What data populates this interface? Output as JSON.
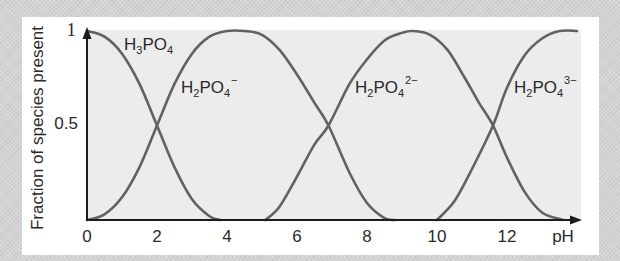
{
  "chart_data": {
    "type": "line",
    "title": "",
    "xlabel": "pH",
    "ylabel": "Fraction of species present",
    "xlim": [
      0,
      14
    ],
    "ylim": [
      0,
      1
    ],
    "x_ticks": [
      "0",
      "2",
      "4",
      "6",
      "8",
      "10",
      "12"
    ],
    "y_ticks": [
      "0.5",
      "1"
    ],
    "grid": false,
    "legend": "inline labels",
    "crossing_points_pH": [
      2.0,
      6.9,
      11.6
    ],
    "series": [
      {
        "name": "H3PO4",
        "label_main": "H",
        "label_sub1": "3",
        "label_mid": "PO",
        "label_sub2": "4",
        "label_sup": "",
        "x": [
          0,
          0.5,
          1.0,
          1.5,
          2.0,
          2.5,
          3.0,
          3.5,
          3.8
        ],
        "values": [
          1.0,
          0.97,
          0.88,
          0.72,
          0.5,
          0.28,
          0.11,
          0.02,
          0.0
        ]
      },
      {
        "name": "H2PO4-",
        "label_main": "H",
        "label_sub1": "2",
        "label_mid": "PO",
        "label_sub2": "4",
        "label_sup": "−",
        "x": [
          0,
          0.5,
          1.0,
          1.5,
          2.0,
          2.5,
          3.0,
          3.5,
          4.0,
          4.5,
          5.0,
          5.5,
          6.0,
          6.5,
          6.9,
          7.5,
          8.0,
          8.5,
          8.8
        ],
        "values": [
          0.0,
          0.03,
          0.12,
          0.28,
          0.5,
          0.72,
          0.88,
          0.97,
          1.0,
          1.0,
          0.98,
          0.9,
          0.77,
          0.62,
          0.5,
          0.25,
          0.09,
          0.01,
          0.0
        ]
      },
      {
        "name": "H2PO4 2-",
        "label_main": "H",
        "label_sub1": "2",
        "label_mid": "PO",
        "label_sub2": "4",
        "label_sup": "2−",
        "x": [
          5.1,
          5.5,
          6.0,
          6.5,
          6.9,
          7.5,
          8.0,
          8.5,
          9.0,
          9.3,
          9.8,
          10.3,
          10.8,
          11.2,
          11.6,
          12.0,
          12.5,
          13.0,
          13.6
        ],
        "values": [
          0.0,
          0.07,
          0.23,
          0.4,
          0.5,
          0.72,
          0.85,
          0.95,
          0.99,
          1.0,
          0.98,
          0.9,
          0.75,
          0.62,
          0.5,
          0.33,
          0.15,
          0.04,
          0.0
        ]
      },
      {
        "name": "H2PO4 3-",
        "label_main": "H",
        "label_sub1": "2",
        "label_mid": "PO",
        "label_sub2": "4",
        "label_sup": "3−",
        "x": [
          10.0,
          10.5,
          11.0,
          11.6,
          12.0,
          12.5,
          13.0,
          13.5,
          14.0
        ],
        "values": [
          0.0,
          0.1,
          0.27,
          0.5,
          0.7,
          0.87,
          0.96,
          1.0,
          1.0
        ]
      }
    ]
  },
  "axes": {
    "x_axis_label": "pH",
    "y_axis_label": "Fraction of species present",
    "x_ticks": [
      {
        "label": "0",
        "v": 0
      },
      {
        "label": "2",
        "v": 2
      },
      {
        "label": "4",
        "v": 4
      },
      {
        "label": "6",
        "v": 6
      },
      {
        "label": "8",
        "v": 8
      },
      {
        "label": "10",
        "v": 10
      },
      {
        "label": "12",
        "v": 12
      }
    ],
    "y_ticks": [
      {
        "label": "1",
        "v": 1
      },
      {
        "label": "0.5",
        "v": 0.5
      }
    ]
  },
  "labels": {
    "h3po4": {
      "a": "H",
      "b": "3",
      "c": "PO",
      "d": "4",
      "e": ""
    },
    "h2po4_minus": {
      "a": "H",
      "b": "2",
      "c": "PO",
      "d": "4",
      "e": "−"
    },
    "h2po4_2minus": {
      "a": "H",
      "b": "2",
      "c": "PO",
      "d": "4",
      "e": "2−"
    },
    "h2po4_3minus": {
      "a": "H",
      "b": "2",
      "c": "PO",
      "d": "4",
      "e": "3−"
    }
  },
  "colors": {
    "curve": "#626262",
    "axis": "#1c1c1c",
    "plot_bg": "#ececec",
    "panel_bg": "#ffffff",
    "frame_bg": "#d3d3d3"
  }
}
